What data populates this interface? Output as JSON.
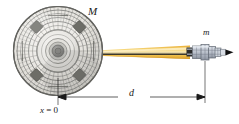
{
  "diagram": {
    "labels": {
      "station_mass": "M",
      "craft_mass": "m",
      "distance": "d",
      "origin": "x = 0",
      "origin_var": "x",
      "origin_eq": "= 0"
    },
    "icons": {
      "station": "space-station-icon",
      "craft": "spacecraft-icon",
      "beam": "tether-beam-icon",
      "dimension": "dimension-arrow-icon"
    },
    "colors": {
      "beam": "#f0c24e",
      "beam_highlight": "#f8dc8c",
      "beam_edge": "#d9a12c",
      "station_fill": "#e9e7e2",
      "station_line": "#7b7b78",
      "panel": "#6e6e68",
      "hub": "#5a5a57",
      "craft_body": "#b9bfc9",
      "craft_line": "#5f6670",
      "nose": "#111111",
      "dimension_line": "#1a1a1a",
      "background": "#ffffff"
    },
    "geometry": {
      "station_center_x": 58,
      "station_center_y": 51,
      "station_radius": 45,
      "craft_x": 205,
      "craft_y": 52,
      "dimension_y": 97,
      "dimension_left_x": 58,
      "dimension_right_x": 205
    }
  }
}
